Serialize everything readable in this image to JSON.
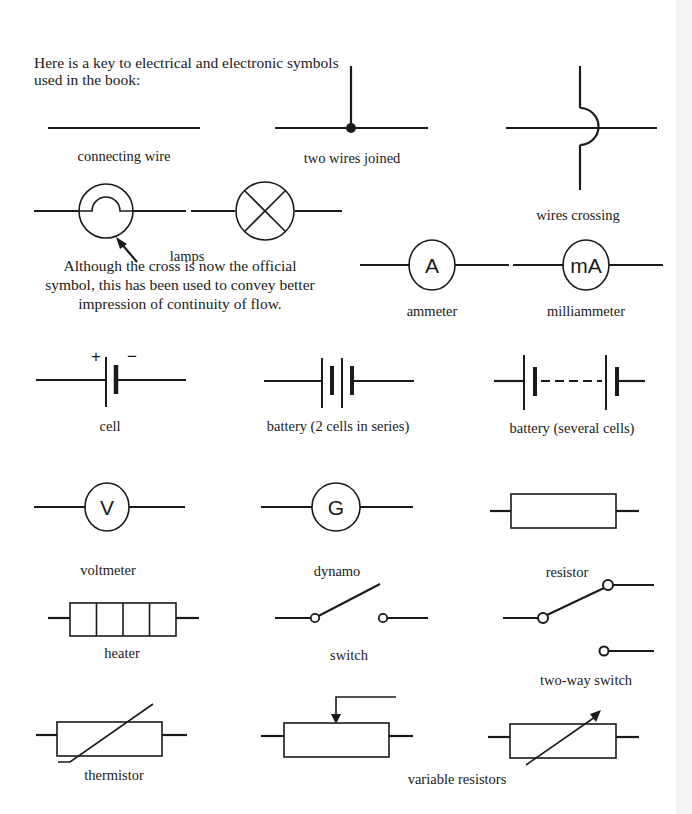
{
  "intro": {
    "line1": "Here is a key to electrical and electronic symbols",
    "line2": "used in the book:"
  },
  "symbols": {
    "connecting_wire": "connecting wire",
    "two_wires_joined": "two wires joined",
    "wires_crossing": "wires crossing",
    "lamps": "lamps",
    "ammeter": "ammeter",
    "milliammeter": "milliammeter",
    "cell": "cell",
    "battery_two": "battery (2 cells in series)",
    "battery_several": "battery (several cells)",
    "voltmeter": "voltmeter",
    "dynamo": "dynamo",
    "resistor": "resistor",
    "heater": "heater",
    "switch": "switch",
    "two_way_switch": "two-way switch",
    "thermistor": "thermistor",
    "variable_resistors": "variable resistors"
  },
  "meter_letters": {
    "ammeter": "A",
    "milliammeter": "mA",
    "voltmeter": "V",
    "dynamo": "G"
  },
  "cell_polarity": {
    "plus": "+",
    "minus": "−"
  },
  "lamp_note": {
    "line1": "Although the cross is now the official",
    "line2": "symbol, this has been used to convey better",
    "line3": "impression of continuity of flow."
  },
  "colors": {
    "ink": "#1a1a1a",
    "background": "#ffffff",
    "edge_strip": "#f4f4f4"
  }
}
